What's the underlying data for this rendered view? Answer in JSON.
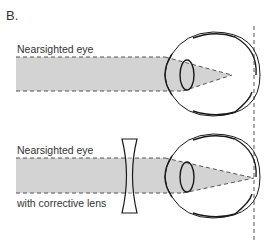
{
  "panel_label": "B.",
  "top": {
    "label": "Nearsighted eye"
  },
  "bottom": {
    "label_line1": "Nearsighted eye",
    "label_line2": "with corrective lens"
  },
  "colors": {
    "beam": "#d3d3d3",
    "stroke": "#1a1a1a",
    "dash": "#555555"
  }
}
